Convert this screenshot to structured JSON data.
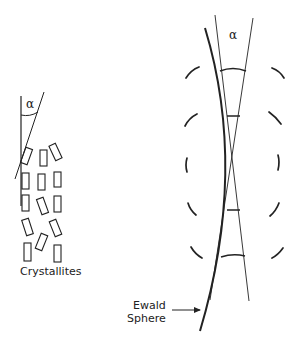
{
  "diagram": {
    "left_panel": {
      "angle_label": "α",
      "crystallites_label": "Crystallites"
    },
    "right_panel": {
      "angle_label": "α",
      "ewald_label_line1": "Ewald",
      "ewald_label_line2": "Sphere"
    },
    "colors": {
      "ink": "#222222",
      "background": "#ffffff"
    }
  }
}
